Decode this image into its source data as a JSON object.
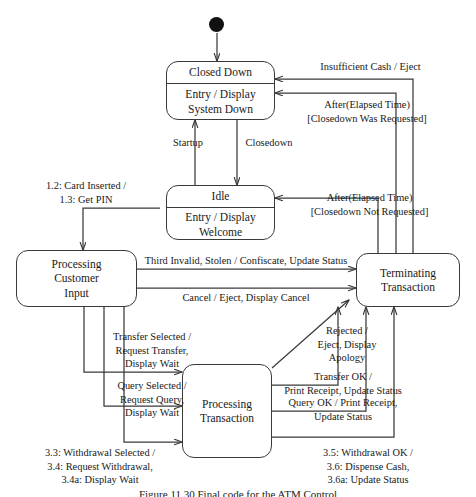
{
  "diagram": {
    "caption": "Figure 11.30   Final  code  for  the  ATM  Control",
    "line_color": "#3a3a3a",
    "text_color": "#1a1a1a",
    "background": "#ffffff"
  },
  "initial_state": {
    "name": "initial-pseudostate"
  },
  "states": [
    {
      "id": "closed_down",
      "name": "Closed Down",
      "activity": "Entry / Display\nSystem Down",
      "activity_line1": "Entry / Display",
      "activity_line2": "System Down"
    },
    {
      "id": "idle",
      "name": "Idle",
      "activity_line1": "Entry / Display",
      "activity_line2": "Welcome"
    },
    {
      "id": "processing_customer_input",
      "name": "Processing Customer Input",
      "name_line1": "Processing",
      "name_line2": "Customer",
      "name_line3": "Input"
    },
    {
      "id": "terminating_transaction",
      "name": "Terminating Transaction",
      "name_line1": "Terminating",
      "name_line2": "Transaction"
    },
    {
      "id": "processing_transaction",
      "name": "Processing Transaction",
      "name_line1": "Processing",
      "name_line2": "Transaction"
    }
  ],
  "transitions": {
    "insufficient_cash": {
      "line1": "Insufficient Cash / Eject"
    },
    "after_elapsed_closedown_requested": {
      "line1": "After(Elapsed Time)",
      "line2": "[Closedown Was Requested]"
    },
    "startup": {
      "line1": "Startup"
    },
    "closedown": {
      "line1": "Closedown"
    },
    "card_inserted": {
      "line1": "1.2: Card Inserted /",
      "line2": "1.3: Get PIN"
    },
    "after_elapsed_closedown_not_requested": {
      "line1": "After(Elapsed Time)",
      "line2": "[Closedown Not Requested]"
    },
    "third_invalid": {
      "line1": "Third Invalid, Stolen / Confiscate, Update Status"
    },
    "cancel_eject": {
      "line1": "Cancel / Eject, Display Cancel"
    },
    "transfer_selected": {
      "line1": "Transfer Selected /",
      "line2": "Request Transfer,",
      "line3": "Display Wait"
    },
    "query_selected": {
      "line1": "Query Selected /",
      "line2": "Request Query,",
      "line3": "Display Wait"
    },
    "withdrawal_selected": {
      "line1": "3.3: Withdrawal Selected /",
      "line2": "3.4: Request Withdrawal,",
      "line3": "3.4a: Display Wait"
    },
    "rejected": {
      "line1": "Rejected /",
      "line2": "Eject, Display",
      "line3": "Apology"
    },
    "transfer_ok": {
      "line1": "Transfer OK /",
      "line2": "Print Receipt, Update Status"
    },
    "query_ok": {
      "line1": "Query OK / Print Receipt,",
      "line2": "Update Status"
    },
    "withdrawal_ok": {
      "line1": "3.5: Withdrawal OK /",
      "line2": "3.6: Dispense Cash,",
      "line3": "3.6a: Update Status"
    }
  }
}
